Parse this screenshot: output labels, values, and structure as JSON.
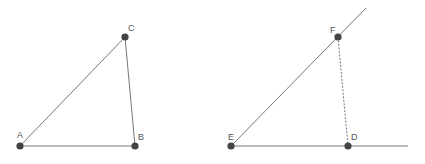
{
  "figures": [
    {
      "name": "triangle-abc",
      "points": [
        {
          "id": "A",
          "x": 20,
          "y": 146,
          "lx": 14,
          "ly": 136
        },
        {
          "id": "B",
          "x": 135,
          "y": 146,
          "lx": 139,
          "ly": 139
        },
        {
          "id": "C",
          "x": 125,
          "y": 37,
          "lx": 128,
          "ly": 29
        }
      ],
      "segments": [
        {
          "from": "A",
          "to": "B",
          "style": "solid"
        },
        {
          "from": "B",
          "to": "C",
          "style": "solid"
        },
        {
          "from": "A",
          "to": "C",
          "style": "solid"
        }
      ]
    },
    {
      "name": "construction-def",
      "points": [
        {
          "id": "E",
          "x": 231,
          "y": 146,
          "lx": 226,
          "ly": 139
        },
        {
          "id": "D",
          "x": 348,
          "y": 146,
          "lx": 352,
          "ly": 139
        },
        {
          "id": "F",
          "x": 338,
          "y": 37,
          "lx": 330,
          "ly": 31
        }
      ],
      "segments": [
        {
          "from": "E",
          "to": "D",
          "style": "solid",
          "extend_to": {
            "x": 408,
            "y": 146
          }
        },
        {
          "from": "E",
          "to": "F",
          "style": "solid",
          "extend_to": {
            "x": 366,
            "y": 8
          }
        },
        {
          "from": "F",
          "to": "D",
          "style": "dashed"
        }
      ]
    }
  ],
  "labels": {
    "A": "A",
    "B": "B",
    "C": "C",
    "D": "D",
    "E": "E",
    "F": "F"
  },
  "colors": {
    "line": "#777777",
    "point": "#444444",
    "label": "#555555"
  }
}
